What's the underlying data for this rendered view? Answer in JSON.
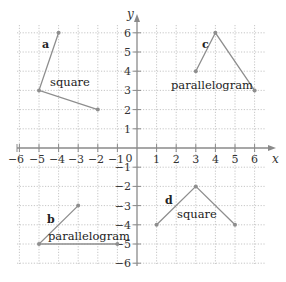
{
  "graph": {
    "x_axis_label": "x",
    "y_axis_label": "y",
    "origin_label": "0",
    "x_range": [
      -6,
      6
    ],
    "y_range": [
      -6,
      6
    ],
    "x_ticks": [
      "−6",
      "−5",
      "−4",
      "−3",
      "−2",
      "−1",
      "1",
      "2",
      "3",
      "4",
      "5",
      "6"
    ],
    "y_ticks": [
      "6",
      "5",
      "4",
      "3",
      "2",
      "1",
      "−1",
      "−2",
      "−3",
      "−4",
      "−5",
      "−6"
    ],
    "grid_color": "#b8b8b8",
    "line_color": "#8e8e8e"
  },
  "figures": [
    {
      "id": "a",
      "letter": "a",
      "shape": "square",
      "points": [
        [
          -4,
          6
        ],
        [
          -5,
          3
        ],
        [
          -2,
          2
        ]
      ]
    },
    {
      "id": "b",
      "letter": "b",
      "shape": "parallelogram",
      "points": [
        [
          -3,
          -3
        ],
        [
          -5,
          -5
        ],
        [
          -1,
          -5
        ]
      ]
    },
    {
      "id": "c",
      "letter": "c",
      "shape": "parallelogram",
      "points": [
        [
          3,
          4
        ],
        [
          4,
          6
        ],
        [
          6,
          3
        ]
      ]
    },
    {
      "id": "d",
      "letter": "d",
      "shape": "square",
      "points": [
        [
          1,
          -4
        ],
        [
          3,
          -2
        ],
        [
          5,
          -4
        ]
      ]
    }
  ]
}
